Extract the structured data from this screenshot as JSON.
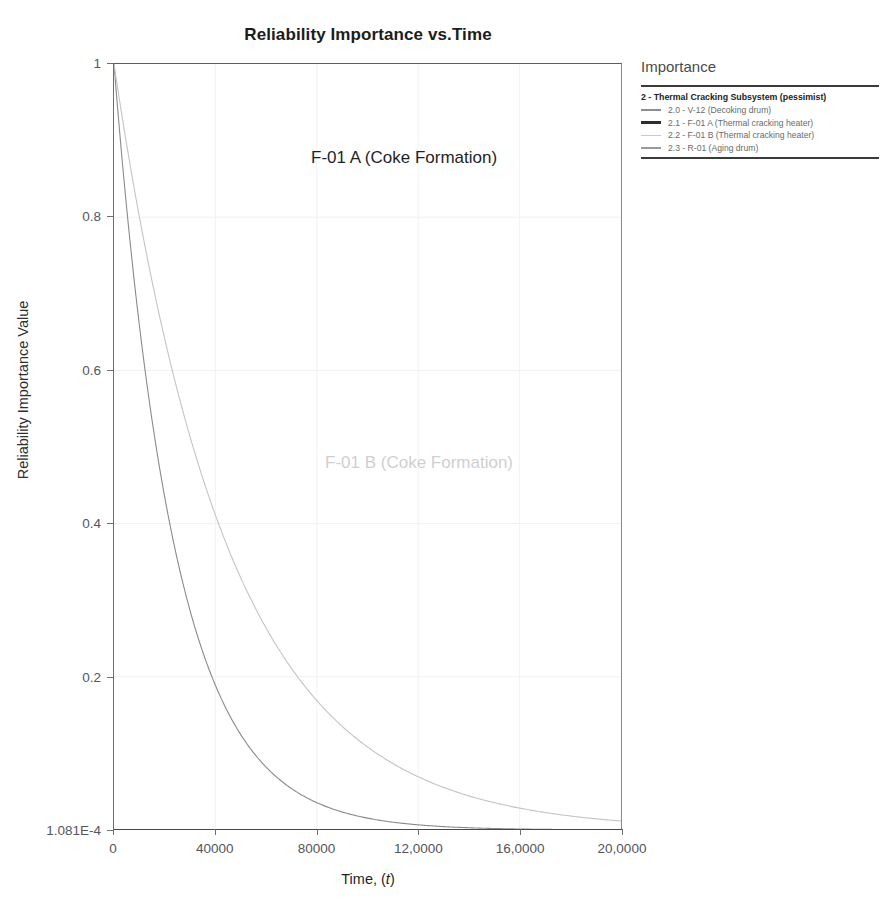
{
  "chart_data": {
    "type": "line",
    "title": "Reliability Importance vs.Time",
    "xlabel": "Time, (t)",
    "ylabel": "Reliability Importance Value",
    "xlim": [
      0,
      200000
    ],
    "ylim": [
      0.0001081,
      1
    ],
    "grid": true,
    "legend_position": "right",
    "x_ticks": [
      {
        "value": 0,
        "label": "0"
      },
      {
        "value": 40000,
        "label": "40000"
      },
      {
        "value": 80000,
        "label": "80000"
      },
      {
        "value": 120000,
        "label": "12,0000"
      },
      {
        "value": 160000,
        "label": "16,0000"
      },
      {
        "value": 200000,
        "label": "20,0000"
      }
    ],
    "y_ticks": [
      {
        "value": 1,
        "label": "1"
      },
      {
        "value": 0.8,
        "label": "0.8"
      },
      {
        "value": 0.6,
        "label": "0.6"
      },
      {
        "value": 0.4,
        "label": "0.4"
      },
      {
        "value": 0.2,
        "label": "0.2"
      },
      {
        "value": 0.0001081,
        "label": "1.081E-4"
      }
    ],
    "series": [
      {
        "name": "2.1 - F-01 A (Thermal cracking heater)",
        "color": "#8a8a8a",
        "width": 1.1,
        "decay_tau": 24000,
        "x": [
          0,
          5000,
          10000,
          15000,
          20000,
          25000,
          30000,
          40000,
          50000,
          60000,
          70000,
          80000,
          90000,
          100000,
          110000,
          120000,
          140000,
          160000,
          180000,
          200000
        ],
        "y": [
          1.0,
          0.812,
          0.659,
          0.535,
          0.435,
          0.353,
          0.287,
          0.189,
          0.124,
          0.082,
          0.054,
          0.036,
          0.023,
          0.015,
          0.01,
          0.0067,
          0.0029,
          0.0013,
          0.0005,
          0.0002
        ]
      },
      {
        "name": "2.2 - F-01 B (Thermal cracking heater)",
        "color": "#c4c4c4",
        "width": 1.1,
        "decay_tau": 45000,
        "x": [
          0,
          5000,
          10000,
          20000,
          30000,
          40000,
          50000,
          60000,
          80000,
          100000,
          120000,
          140000,
          160000,
          180000,
          200000
        ],
        "y": [
          1.0,
          0.895,
          0.801,
          0.641,
          0.513,
          0.411,
          0.329,
          0.264,
          0.169,
          0.108,
          0.069,
          0.044,
          0.028,
          0.018,
          0.012
        ]
      }
    ],
    "annotations": [
      {
        "text": "F-01 A (Coke Formation)",
        "color": "#1f1f1f"
      },
      {
        "text": "F-01 B (Coke Formation)",
        "color": "#cfcfcf"
      }
    ]
  },
  "legend": {
    "title": "Importance",
    "group_label": "2 - Thermal Cracking Subsystem (pessimist)",
    "items": [
      {
        "label": "2.0 - V-12 (Decoking drum)",
        "color": "#8e8e8e",
        "thickness": 2.0
      },
      {
        "label": "2.1 - F-01 A (Thermal cracking heater)",
        "color": "#2e2e2e",
        "thickness": 3.0
      },
      {
        "label": "2.2 - F-01 B (Thermal cracking heater)",
        "color": "#cacaca",
        "thickness": 1.6
      },
      {
        "label": "2.3 - R-01 (Aging drum)",
        "color": "#9a9a9a",
        "thickness": 2.0
      }
    ]
  }
}
